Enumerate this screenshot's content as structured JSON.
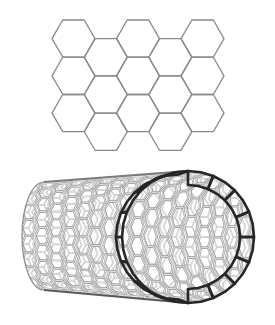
{
  "figure": {
    "background": "#ffffff"
  },
  "graphene_sheet": {
    "label": "graphene-sheet",
    "orientation": "flat-top hexagons",
    "columns": 5,
    "rows_even_columns": 3,
    "rows_odd_columns": 3,
    "hex_side": 21.5,
    "origin_x": 52,
    "origin_y": 20,
    "stroke": "#8a8a8a",
    "stroke_width": 1.3
  },
  "nanotube": {
    "label": "carbon-nanotube",
    "body_left_x": 22,
    "back_end": {
      "cx": 44,
      "cy": 236,
      "rx": 22,
      "ry": 54
    },
    "front_mouth": {
      "cx": 188,
      "cy": 237,
      "rx": 66,
      "ry": 66
    },
    "hex_column_spacing": 13.5,
    "hex_rows": 9,
    "tube_stroke": "#9a9a9a",
    "tube_fill": "#f4f4f4",
    "tube_highlight": "#ffffff",
    "tube_shadow": "#5a5a5a",
    "ring_color": "#262626",
    "ring_hex_count": 16
  }
}
